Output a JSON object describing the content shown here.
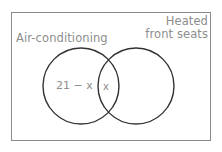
{
  "diagram": {
    "type": "venn-two-set",
    "universe_label": "",
    "sets": [
      {
        "id": "left",
        "label": "Air-conditioning"
      },
      {
        "id": "right",
        "label": "Heated\nfront seats"
      }
    ],
    "right_label_line1": "Heated",
    "right_label_line2": "front seats",
    "regions": [
      {
        "id": "left-only",
        "text": "21 − x"
      },
      {
        "id": "intersection",
        "text": "x"
      }
    ],
    "left_only_text": "21 − x",
    "intersection_text": "x",
    "colors": {
      "box_stroke": "#8a8a8a",
      "circle_stroke": "#333333",
      "label_text": "#8d8d8d",
      "background": "#ffffff"
    },
    "geometry": {
      "box": {
        "x": 11,
        "y": 12,
        "width": 200,
        "height": 129
      },
      "left_circle": {
        "cx": 81,
        "cy": 86,
        "r": 38
      },
      "right_circle": {
        "cx": 136,
        "cy": 86,
        "r": 38
      }
    }
  }
}
